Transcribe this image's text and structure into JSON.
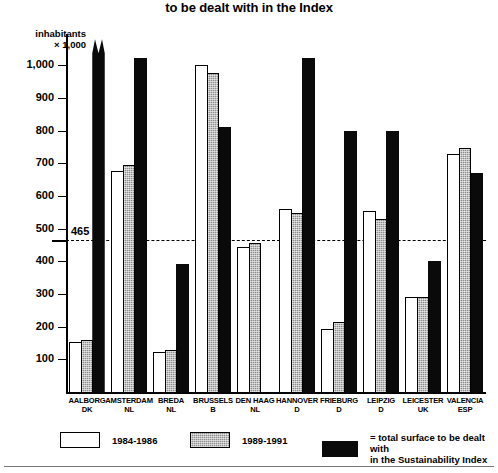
{
  "chart": {
    "title": "to be dealt with in the Index",
    "axis_caption_line1": "inhabitants",
    "axis_caption_line2": "× 1,000",
    "threshold_label": "465"
  },
  "legend": {
    "items": [
      {
        "key": "white",
        "label": "1984-1986"
      },
      {
        "key": "gray",
        "label": "1989-1991"
      },
      {
        "key": "black",
        "label": "= total surface to be dealt with\n   in the Sustainability Index"
      }
    ]
  },
  "chart_data": {
    "type": "bar",
    "title": "to be dealt with in the Index",
    "xlabel": "",
    "ylabel": "inhabitants × 1,000",
    "ylim": [
      0,
      1050
    ],
    "yticks": [
      100,
      200,
      300,
      400,
      500,
      600,
      700,
      800,
      900,
      1000
    ],
    "ytick_labels": [
      "100",
      "200",
      "300",
      "400",
      "500",
      "600",
      "700",
      "800",
      "900",
      "1,000"
    ],
    "grid": false,
    "legend_position": "bottom",
    "threshold": {
      "value": 465,
      "label": "465",
      "style": "dashed"
    },
    "categories": [
      "AALBORG\nDK",
      "AMSTERDAM\nNL",
      "BREDA\nNL",
      "BRUSSELS\nB",
      "DEN HAAG\nNL",
      "HANNOVER\nD",
      "FRIEBURG\nD",
      "LEIPZIG\nD",
      "LEICESTER\nUK",
      "VALENCIA\nESP"
    ],
    "category_names": [
      "AALBORG",
      "AMSTERDAM",
      "BREDA",
      "BRUSSELS",
      "DEN HAAG",
      "HANNOVER",
      "FRIEBURG",
      "LEIPZIG",
      "LEICESTER",
      "VALENCIA"
    ],
    "category_countries": [
      "DK",
      "NL",
      "NL",
      "B",
      "NL",
      "D",
      "D",
      "D",
      "UK",
      "ESP"
    ],
    "series": [
      {
        "name": "1984-1986",
        "color": "#ffffff",
        "values": [
          152,
          675,
          122,
          1000,
          445,
          560,
          192,
          555,
          290,
          730
        ]
      },
      {
        "name": "1989-1991",
        "color": "#8d8d8d",
        "values": [
          160,
          695,
          130,
          978,
          455,
          548,
          214,
          530,
          290,
          748
        ]
      },
      {
        "name": "= total surface to be dealt with in the Sustainability Index",
        "color": "#0a0a0a",
        "values": [
          1080,
          1022,
          392,
          812,
          0,
          1022,
          800,
          800,
          400,
          670
        ],
        "clipped": [
          true,
          false,
          false,
          false,
          false,
          false,
          false,
          false,
          false,
          false
        ]
      }
    ]
  }
}
